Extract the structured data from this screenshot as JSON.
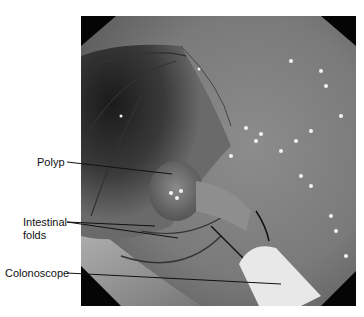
{
  "figure": {
    "labels": [
      {
        "id": "polyp",
        "text": "Polyp"
      },
      {
        "id": "folds",
        "text": "Intestinal\nfolds",
        "line1": "Intestinal",
        "line2": "folds"
      },
      {
        "id": "scope",
        "text": "Colonoscope"
      }
    ]
  }
}
